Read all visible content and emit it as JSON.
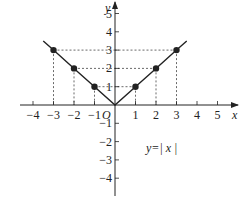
{
  "chart_data": {
    "type": "line",
    "title": "",
    "function_label": "y=| x |",
    "xlabel": "x",
    "ylabel": "y",
    "origin_label": "O",
    "xlim": [
      -4.5,
      5.5
    ],
    "ylim": [
      -4.5,
      5.5
    ],
    "grid": false,
    "x_ticks": [
      -4,
      -3,
      -2,
      -1,
      1,
      2,
      3,
      4,
      5
    ],
    "x_tick_labels": [
      "−4",
      "−3",
      "−2",
      "−1",
      "1",
      "2",
      "3",
      "4",
      "5"
    ],
    "y_ticks": [
      -4,
      -3,
      -2,
      -1,
      1,
      2,
      3,
      4,
      5
    ],
    "y_tick_labels": [
      "−4",
      "−3",
      "−2",
      "−1",
      "1",
      "2",
      "3",
      "4",
      "5"
    ],
    "series": [
      {
        "name": "y=|x|",
        "x": [
          -3.5,
          -3,
          -2,
          -1,
          0,
          1,
          2,
          3,
          3.5
        ],
        "y": [
          3.5,
          3,
          2,
          1,
          0,
          1,
          2,
          3,
          3.5
        ]
      }
    ],
    "marked_points": [
      {
        "x": -3,
        "y": 3
      },
      {
        "x": -2,
        "y": 2
      },
      {
        "x": -1,
        "y": 1
      },
      {
        "x": 1,
        "y": 1
      },
      {
        "x": 2,
        "y": 2
      },
      {
        "x": 3,
        "y": 3
      }
    ],
    "dashed_guides": true
  }
}
